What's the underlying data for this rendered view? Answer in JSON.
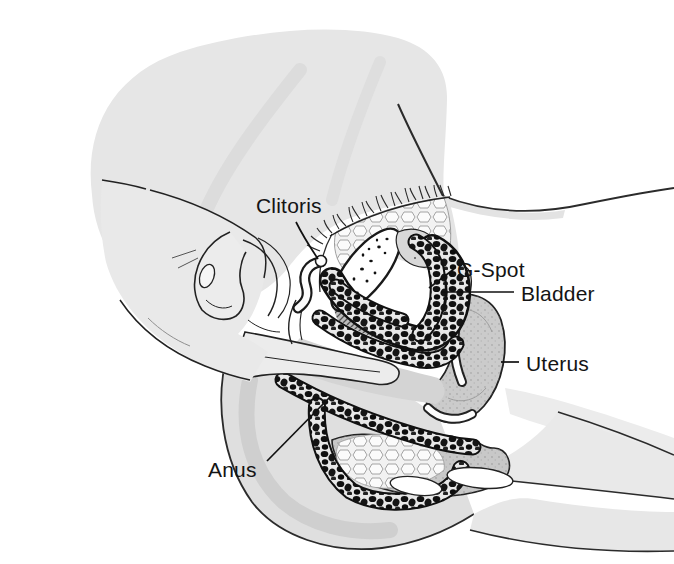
{
  "figure": {
    "labels": {
      "clitoris": "Clitoris",
      "g_spot": "G-Spot",
      "bladder": "Bladder",
      "uterus": "Uterus",
      "anus": "Anus"
    },
    "style": {
      "background": "#ffffff",
      "ink": "#1a1a1a",
      "body_gray": "#e6e6e6",
      "organ_gray": "#cbcbcb",
      "bead_black": "#111111"
    }
  }
}
